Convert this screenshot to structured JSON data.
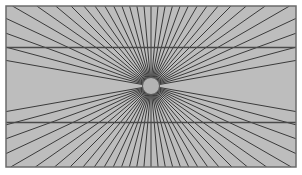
{
  "figure": {
    "caption": ""
  },
  "colors": {
    "page_background": "#ffffff",
    "panel_fill": "#bdbdbd",
    "panel_border": "#6b6b6b",
    "ray_stroke": "#3a3a3a",
    "horizontal_line_stroke": "#4a4a4a",
    "circle_fill": "#b3b3b3",
    "circle_stroke": "#555555",
    "caption_color": "#d9d9d9"
  },
  "chart_data": {
    "type": "scatter",
    "xlabel": "",
    "ylabel": "",
    "panel": {
      "x": 6,
      "y": 6,
      "width": 290,
      "height": 161,
      "fill": "#bdbdbd",
      "border_width": 1.5
    },
    "center": {
      "x": 151,
      "y": 86
    },
    "circle": {
      "cx": 151,
      "cy": 86,
      "r": 8.5
    },
    "rays": {
      "count": 72,
      "stroke_width": 1.0,
      "angle_start_deg": 0,
      "angle_step_deg": 5,
      "suppressed_angle_band_deg": 7,
      "note": "Straight lines radiate outward from the central circle to the panel edges; rays nearly parallel to the horizontal axis are omitted."
    },
    "horizontal_lines": [
      {
        "label": "upper-horizontal",
        "y": 47.5,
        "x1": 6,
        "x2": 296
      },
      {
        "label": "lower-horizontal",
        "y": 122.5,
        "x1": 6,
        "x2": 296
      }
    ],
    "grid": false,
    "legend": null,
    "annotations": []
  }
}
